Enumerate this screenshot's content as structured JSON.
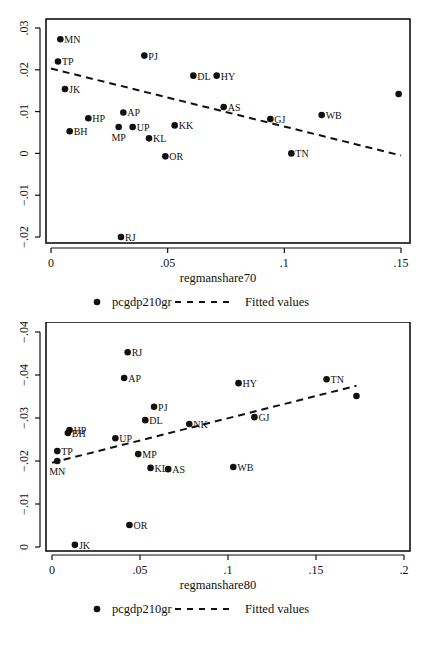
{
  "chart_data": [
    {
      "type": "scatter",
      "title": "",
      "xlabel": "regmanshare70",
      "ylabel": "",
      "xlim": [
        0,
        0.155
      ],
      "ylim": [
        -0.021,
        0.032
      ],
      "xticks": [
        "0",
        ".05",
        ".1",
        ".15"
      ],
      "xtick_values": [
        0,
        0.05,
        0.1,
        0.15
      ],
      "yticks": [
        "-.02",
        "-.01",
        "0",
        ".01",
        ".02",
        ".03"
      ],
      "ytick_values": [
        -0.02,
        -0.01,
        0,
        0.01,
        0.02,
        0.03
      ],
      "grid": false,
      "legend": {
        "position": "bottom",
        "entries": [
          "pcgdp210gr",
          "Fitted values"
        ]
      },
      "series": [
        {
          "name": "pcgdp210gr",
          "kind": "scatter",
          "points": [
            {
              "label": "MN",
              "x": 0.004,
              "y": 0.0273
            },
            {
              "label": "TP",
              "x": 0.003,
              "y": 0.022
            },
            {
              "label": "PJ",
              "x": 0.04,
              "y": 0.0234
            },
            {
              "label": "DL",
              "x": 0.061,
              "y": 0.0186
            },
            {
              "label": "HY",
              "x": 0.071,
              "y": 0.0186
            },
            {
              "label": "JK",
              "x": 0.006,
              "y": 0.0154
            },
            {
              "label": "AS",
              "x": 0.074,
              "y": 0.0111
            },
            {
              "label": "WB",
              "x": 0.116,
              "y": 0.0092
            },
            {
              "label": "GJ",
              "x": 0.094,
              "y": 0.0082
            },
            {
              "label": "AP",
              "x": 0.031,
              "y": 0.0098
            },
            {
              "label": "HP",
              "x": 0.016,
              "y": 0.0084
            },
            {
              "label": "MP",
              "x": 0.029,
              "y": 0.0063,
              "label_pos": "below"
            },
            {
              "label": "UP",
              "x": 0.035,
              "y": 0.0063
            },
            {
              "label": "KK",
              "x": 0.053,
              "y": 0.0067
            },
            {
              "label": "BH",
              "x": 0.008,
              "y": 0.0053
            },
            {
              "label": "KL",
              "x": 0.042,
              "y": 0.0036
            },
            {
              "label": "OR",
              "x": 0.049,
              "y": -0.0007
            },
            {
              "label": "TN",
              "x": 0.103,
              "y": 0.0
            },
            {
              "label": "RJ",
              "x": 0.03,
              "y": -0.02
            },
            {
              "label": "",
              "x": 0.149,
              "y": 0.0142
            }
          ]
        },
        {
          "name": "Fitted values",
          "kind": "line",
          "style": "dashed",
          "points": [
            {
              "x": 0.0,
              "y": 0.0203
            },
            {
              "x": 0.15,
              "y": -0.0005
            }
          ]
        }
      ]
    },
    {
      "type": "scatter",
      "title": "",
      "xlabel": "regmanshare80",
      "ylabel": "",
      "xlim": [
        0,
        0.205
      ],
      "ylim": [
        -0.05,
        0.001
      ],
      "xticks": [
        "0",
        ".05",
        ".1",
        ".15",
        ".2"
      ],
      "xtick_values": [
        0,
        0.05,
        0.1,
        0.15,
        0.2
      ],
      "yticks": [
        "0",
        "-.01",
        "-.02",
        "-.03",
        "-.04",
        "-.04"
      ],
      "ytick_values": [
        0,
        -0.01,
        -0.02,
        -0.03,
        -0.04,
        -0.05
      ],
      "y_axis_direction": "increasingly negative upward",
      "grid": false,
      "legend": {
        "position": "bottom",
        "entries": [
          "pcgdp210gr",
          "Fitted values"
        ]
      },
      "series": [
        {
          "name": "pcgdp210gr",
          "kind": "scatter",
          "points": [
            {
              "label": "RJ",
              "x": 0.043,
              "y": -0.0453
            },
            {
              "label": "AP",
              "x": 0.041,
              "y": -0.0393
            },
            {
              "label": "HY",
              "x": 0.106,
              "y": -0.0381
            },
            {
              "label": "TN",
              "x": 0.156,
              "y": -0.039
            },
            {
              "label": "",
              "x": 0.173,
              "y": -0.0351
            },
            {
              "label": "PJ",
              "x": 0.058,
              "y": -0.0326
            },
            {
              "label": "GJ",
              "x": 0.115,
              "y": -0.0302
            },
            {
              "label": "DL",
              "x": 0.053,
              "y": -0.0295
            },
            {
              "label": "NK",
              "x": 0.078,
              "y": -0.0286
            },
            {
              "label": "HP",
              "x": 0.01,
              "y": -0.0272
            },
            {
              "label": "BH",
              "x": 0.009,
              "y": -0.0265
            },
            {
              "label": "UP",
              "x": 0.036,
              "y": -0.0253
            },
            {
              "label": "TP",
              "x": 0.003,
              "y": -0.0223
            },
            {
              "label": "MP",
              "x": 0.049,
              "y": -0.0216
            },
            {
              "label": "MN",
              "x": 0.003,
              "y": -0.02,
              "label_pos": "below"
            },
            {
              "label": "WB",
              "x": 0.103,
              "y": -0.0186
            },
            {
              "label": "KL",
              "x": 0.056,
              "y": -0.0184
            },
            {
              "label": "AS",
              "x": 0.066,
              "y": -0.0181
            },
            {
              "label": "OR",
              "x": 0.044,
              "y": -0.0051
            },
            {
              "label": "JK",
              "x": 0.013,
              "y": -0.0005
            }
          ]
        },
        {
          "name": "Fitted values",
          "kind": "line",
          "style": "dashed",
          "points": [
            {
              "x": 0.0,
              "y": -0.0196
            },
            {
              "x": 0.173,
              "y": -0.0375
            }
          ]
        }
      ]
    }
  ],
  "layout": [
    {
      "frame": {
        "left": 46,
        "top": 19,
        "right": 410,
        "bottom": 243
      },
      "x_px": {
        "v0": 0,
        "p0": 51,
        "v1": 0.15,
        "p1": 401
      },
      "y_px": {
        "v0": 0.03,
        "p0": 28,
        "v1": -0.02,
        "p1": 237
      },
      "xaxis_y": 248,
      "yaxis_x": 40,
      "xlabel_y": 282,
      "legend_y": 306
    },
    {
      "frame": {
        "left": 46,
        "top": 0,
        "right": 410,
        "bottom": 229
      },
      "x_px": {
        "v0": 0,
        "p0": 52,
        "v1": 0.2,
        "p1": 404
      },
      "y_px": {
        "v0": 0,
        "p0": 225,
        "v1": -0.05,
        "p1": 10
      },
      "xaxis_y": 233,
      "yaxis_x": 40,
      "xlabel_y": 267,
      "legend_y": 291
    }
  ],
  "style": {
    "ink": "#111111",
    "background": "#ffffff"
  }
}
